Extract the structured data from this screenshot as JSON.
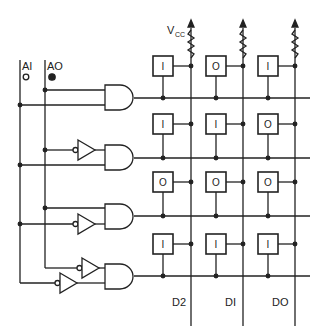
{
  "diagram": {
    "type": "ROM address decoder with diode/bit matrix",
    "inputs": [
      {
        "label": "AI",
        "state_symbol": "open-circle",
        "state": 0
      },
      {
        "label": "AO",
        "state_symbol": "filled-circle",
        "state": 1
      }
    ],
    "supply_label": "V",
    "supply_subscript": "CC",
    "outputs": [
      "D2",
      "DI",
      "DO"
    ],
    "rows": [
      {
        "gate": "AND",
        "inverters": [],
        "cells": [
          "I",
          "O",
          "I"
        ]
      },
      {
        "gate": "AND",
        "inverters": [
          "AO"
        ],
        "cells": [
          "I",
          "I",
          "O"
        ]
      },
      {
        "gate": "AND",
        "inverters": [
          "AI"
        ],
        "cells": [
          "O",
          "O",
          "O"
        ]
      },
      {
        "gate": "AND",
        "inverters": [
          "AO",
          "AI"
        ],
        "cells": [
          "I",
          "I",
          "I"
        ]
      }
    ]
  }
}
